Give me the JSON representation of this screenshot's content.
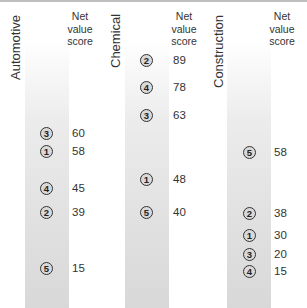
{
  "chart_data": {
    "type": "dot-strip",
    "value_header": "Net value score",
    "panels": [
      {
        "category": "Automotive",
        "points": [
          {
            "rank": "3",
            "value": 60
          },
          {
            "rank": "1",
            "value": 58
          },
          {
            "rank": "4",
            "value": 45
          },
          {
            "rank": "2",
            "value": 39
          },
          {
            "rank": "5",
            "value": 15
          }
        ]
      },
      {
        "category": "Chemical",
        "points": [
          {
            "rank": "2",
            "value": 89
          },
          {
            "rank": "4",
            "value": 78
          },
          {
            "rank": "3",
            "value": 63
          },
          {
            "rank": "1",
            "value": 48
          },
          {
            "rank": "5",
            "value": 40
          }
        ]
      },
      {
        "category": "Construction",
        "points": [
          {
            "rank": "5",
            "value": 58
          },
          {
            "rank": "2",
            "value": 38
          },
          {
            "rank": "1",
            "value": 30
          },
          {
            "rank": "3",
            "value": 20
          },
          {
            "rank": "4",
            "value": 15
          }
        ]
      }
    ]
  },
  "header": {
    "line1": "Net",
    "line2": "value",
    "line3": "score"
  }
}
